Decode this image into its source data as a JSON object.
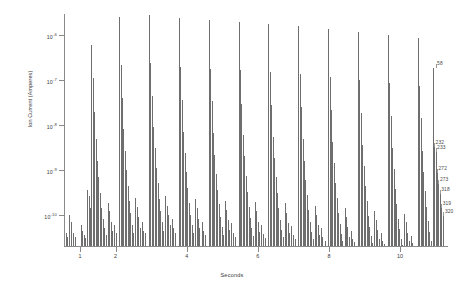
{
  "chart_data": {
    "type": "bar",
    "title": "",
    "subtitle": "",
    "xlabel": "Seconds",
    "ylabel": "Ion Current (Amperes)",
    "yscale": "log",
    "ylim": [
      2e-11,
      3e-06
    ],
    "xlim": [
      0.55,
      11.35
    ],
    "grid": false,
    "legend": null,
    "y_ticks": [
      {
        "value": 1e-06,
        "label": "10",
        "exp": "-6"
      },
      {
        "value": 1e-07,
        "label": "10",
        "exp": "-7"
      },
      {
        "value": 1e-08,
        "label": "10",
        "exp": "-8"
      },
      {
        "value": 1e-09,
        "label": "10",
        "exp": "-9"
      },
      {
        "value": 1e-10,
        "label": "10",
        "exp": "-10"
      }
    ],
    "x_ticks": [
      {
        "value": 1,
        "label": "1"
      },
      {
        "value": 2,
        "label": "2"
      },
      {
        "value": 4,
        "label": "4"
      },
      {
        "value": 6,
        "label": "6"
      },
      {
        "value": 8,
        "label": "8"
      },
      {
        "value": 10,
        "label": "10"
      }
    ],
    "annotations": [
      {
        "label": "58",
        "x": 11.0,
        "y": 2e-07
      },
      {
        "label": "232",
        "x": 10.96,
        "y": 3.4e-09
      },
      {
        "label": "233",
        "x": 11.0,
        "y": 2.6e-09
      },
      {
        "label": "272",
        "x": 11.04,
        "y": 9e-10
      },
      {
        "label": "273",
        "x": 11.08,
        "y": 5.2e-10
      },
      {
        "label": "318",
        "x": 11.12,
        "y": 3e-10
      },
      {
        "label": "319",
        "x": 11.16,
        "y": 1.5e-10
      },
      {
        "label": "320",
        "x": 11.22,
        "y": 1e-10
      }
    ],
    "series": [
      {
        "name": "Ion Current",
        "color": "#6e6e6e",
        "points": [
          [
            0.6,
            4e-11
          ],
          [
            0.64,
            3.2e-11
          ],
          [
            0.7,
            1e-10
          ],
          [
            0.74,
            7e-11
          ],
          [
            0.8,
            4e-11
          ],
          [
            0.86,
            3.2e-11
          ],
          [
            1.02,
            6e-11
          ],
          [
            1.06,
            4.4e-11
          ],
          [
            1.1,
            3.6e-11
          ],
          [
            1.14,
            3e-11
          ],
          [
            1.2,
            3.6e-10
          ],
          [
            1.24,
            2.6e-10
          ],
          [
            1.28,
            1.4e-10
          ],
          [
            1.32,
            6e-07
          ],
          [
            1.36,
            1.1e-07
          ],
          [
            1.4,
            2e-08
          ],
          [
            1.44,
            5e-09
          ],
          [
            1.48,
            1.6e-09
          ],
          [
            1.52,
            7e-10
          ],
          [
            1.56,
            3e-10
          ],
          [
            1.6,
            1.4e-10
          ],
          [
            1.64,
            8e-11
          ],
          [
            1.68,
            5e-11
          ],
          [
            1.72,
            3.6e-11
          ],
          [
            1.78,
            1.8e-10
          ],
          [
            1.82,
            1.2e-10
          ],
          [
            1.86,
            7e-11
          ],
          [
            1.9,
            4.4e-11
          ],
          [
            1.96,
            6e-11
          ],
          [
            2.0,
            4e-11
          ],
          [
            2.1,
            2.6e-06
          ],
          [
            2.14,
            2.2e-07
          ],
          [
            2.18,
            4e-08
          ],
          [
            2.22,
            8e-09
          ],
          [
            2.26,
            2.6e-09
          ],
          [
            2.3,
            1e-09
          ],
          [
            2.34,
            4.4e-10
          ],
          [
            2.38,
            2e-10
          ],
          [
            2.42,
            1.1e-10
          ],
          [
            2.46,
            6e-11
          ],
          [
            2.5,
            4e-11
          ],
          [
            2.56,
            2.4e-10
          ],
          [
            2.6,
            1.5e-10
          ],
          [
            2.64,
            9e-11
          ],
          [
            2.68,
            5e-11
          ],
          [
            2.74,
            7e-11
          ],
          [
            2.78,
            4.4e-11
          ],
          [
            2.84,
            4e-11
          ],
          [
            2.94,
            2.8e-06
          ],
          [
            2.98,
            2.4e-07
          ],
          [
            3.02,
            4.4e-08
          ],
          [
            3.06,
            9e-09
          ],
          [
            3.1,
            3e-09
          ],
          [
            3.14,
            1.1e-09
          ],
          [
            3.18,
            5e-10
          ],
          [
            3.22,
            2.2e-10
          ],
          [
            3.26,
            1.2e-10
          ],
          [
            3.3,
            7e-11
          ],
          [
            3.34,
            4.4e-11
          ],
          [
            3.4,
            2.6e-10
          ],
          [
            3.44,
            1.6e-10
          ],
          [
            3.48,
            1e-10
          ],
          [
            3.52,
            6e-11
          ],
          [
            3.58,
            8e-11
          ],
          [
            3.62,
            5e-11
          ],
          [
            3.68,
            4e-11
          ],
          [
            3.78,
            2.4e-06
          ],
          [
            3.82,
            2e-07
          ],
          [
            3.86,
            3.6e-08
          ],
          [
            3.9,
            7e-09
          ],
          [
            3.94,
            2.4e-09
          ],
          [
            3.98,
            9e-10
          ],
          [
            4.02,
            4e-10
          ],
          [
            4.06,
            1.8e-10
          ],
          [
            4.1,
            1e-10
          ],
          [
            4.14,
            6e-11
          ],
          [
            4.18,
            4e-11
          ],
          [
            4.24,
            2.2e-10
          ],
          [
            4.28,
            1.4e-10
          ],
          [
            4.32,
            8e-11
          ],
          [
            4.36,
            5e-11
          ],
          [
            4.42,
            7e-11
          ],
          [
            4.46,
            4.4e-11
          ],
          [
            4.52,
            3.6e-11
          ],
          [
            4.62,
            2.2e-06
          ],
          [
            4.66,
            1.8e-07
          ],
          [
            4.7,
            3.4e-08
          ],
          [
            4.74,
            6.6e-09
          ],
          [
            4.78,
            2.2e-09
          ],
          [
            4.82,
            8e-10
          ],
          [
            4.86,
            3.6e-10
          ],
          [
            4.9,
            1.7e-10
          ],
          [
            4.94,
            9e-11
          ],
          [
            4.98,
            5.4e-11
          ],
          [
            5.02,
            3.6e-11
          ],
          [
            5.08,
            2e-10
          ],
          [
            5.12,
            1.3e-10
          ],
          [
            5.16,
            7.6e-11
          ],
          [
            5.2,
            4.6e-11
          ],
          [
            5.26,
            6.4e-11
          ],
          [
            5.3,
            4e-11
          ],
          [
            5.36,
            3.2e-11
          ],
          [
            5.46,
            2e-06
          ],
          [
            5.5,
            1.7e-07
          ],
          [
            5.54,
            3e-08
          ],
          [
            5.58,
            6e-09
          ],
          [
            5.62,
            2e-09
          ],
          [
            5.66,
            7.4e-10
          ],
          [
            5.7,
            3.2e-10
          ],
          [
            5.74,
            1.5e-10
          ],
          [
            5.78,
            8.4e-11
          ],
          [
            5.82,
            5e-11
          ],
          [
            5.86,
            3.4e-11
          ],
          [
            5.92,
            1.9e-10
          ],
          [
            5.96,
            1.2e-10
          ],
          [
            6.0,
            7e-11
          ],
          [
            6.04,
            4.2e-11
          ],
          [
            6.1,
            6e-11
          ],
          [
            6.14,
            3.8e-11
          ],
          [
            6.2,
            3e-11
          ],
          [
            6.3,
            1.8e-06
          ],
          [
            6.34,
            1.5e-07
          ],
          [
            6.38,
            2.8e-08
          ],
          [
            6.42,
            5.4e-09
          ],
          [
            6.46,
            1.8e-09
          ],
          [
            6.5,
            6.8e-10
          ],
          [
            6.54,
            3e-10
          ],
          [
            6.58,
            1.4e-10
          ],
          [
            6.62,
            7.8e-11
          ],
          [
            6.66,
            4.6e-11
          ],
          [
            6.7,
            3.2e-11
          ],
          [
            6.76,
            1.8e-10
          ],
          [
            6.8,
            1.1e-10
          ],
          [
            6.84,
            6.4e-11
          ],
          [
            6.88,
            4e-11
          ],
          [
            6.94,
            5.6e-11
          ],
          [
            6.98,
            3.6e-11
          ],
          [
            7.04,
            2.8e-11
          ],
          [
            7.14,
            1.6e-06
          ],
          [
            7.18,
            1.35e-07
          ],
          [
            7.22,
            2.5e-08
          ],
          [
            7.26,
            4.8e-09
          ],
          [
            7.3,
            1.6e-09
          ],
          [
            7.34,
            6e-10
          ],
          [
            7.38,
            2.7e-10
          ],
          [
            7.42,
            1.25e-10
          ],
          [
            7.46,
            7e-11
          ],
          [
            7.5,
            4.2e-11
          ],
          [
            7.54,
            2.9e-11
          ],
          [
            7.6,
            1.6e-10
          ],
          [
            7.64,
            1e-10
          ],
          [
            7.68,
            5.8e-11
          ],
          [
            7.72,
            3.6e-11
          ],
          [
            7.78,
            5e-11
          ],
          [
            7.82,
            3.2e-11
          ],
          [
            7.88,
            2.6e-11
          ],
          [
            7.98,
            1.4e-06
          ],
          [
            8.02,
            1.2e-07
          ],
          [
            8.06,
            2.2e-08
          ],
          [
            8.1,
            4.2e-09
          ],
          [
            8.14,
            1.4e-09
          ],
          [
            8.18,
            5.2e-10
          ],
          [
            8.22,
            2.3e-10
          ],
          [
            8.26,
            1.1e-10
          ],
          [
            8.3,
            6.2e-11
          ],
          [
            8.34,
            3.8e-11
          ],
          [
            8.38,
            2.6e-11
          ],
          [
            8.44,
            1.4e-10
          ],
          [
            8.48,
            9e-11
          ],
          [
            8.52,
            5.2e-11
          ],
          [
            8.56,
            3.2e-11
          ],
          [
            8.62,
            4.4e-11
          ],
          [
            8.66,
            2.9e-11
          ],
          [
            8.72,
            2.4e-11
          ],
          [
            8.82,
            1.2e-06
          ],
          [
            8.86,
            1e-07
          ],
          [
            8.9,
            1.9e-08
          ],
          [
            8.94,
            3.6e-09
          ],
          [
            8.98,
            1.2e-09
          ],
          [
            9.02,
            4.4e-10
          ],
          [
            9.06,
            2e-10
          ],
          [
            9.1,
            9.4e-11
          ],
          [
            9.14,
            5.4e-11
          ],
          [
            9.18,
            3.3e-11
          ],
          [
            9.22,
            2.3e-11
          ],
          [
            9.28,
            1.2e-10
          ],
          [
            9.32,
            7.8e-11
          ],
          [
            9.36,
            4.6e-11
          ],
          [
            9.4,
            2.9e-11
          ],
          [
            9.46,
            3.9e-11
          ],
          [
            9.5,
            2.6e-11
          ],
          [
            9.56,
            2.2e-11
          ],
          [
            9.66,
            1e-06
          ],
          [
            9.7,
            8.6e-08
          ],
          [
            9.74,
            1.6e-08
          ],
          [
            9.78,
            3.1e-09
          ],
          [
            9.82,
            1.05e-09
          ],
          [
            9.86,
            3.8e-10
          ],
          [
            9.9,
            1.7e-10
          ],
          [
            9.94,
            8.2e-11
          ],
          [
            9.98,
            4.8e-11
          ],
          [
            10.02,
            2.9e-11
          ],
          [
            10.06,
            2.1e-11
          ],
          [
            10.12,
            1.05e-10
          ],
          [
            10.16,
            6.8e-11
          ],
          [
            10.2,
            4e-11
          ],
          [
            10.24,
            2.6e-11
          ],
          [
            10.3,
            3.4e-11
          ],
          [
            10.34,
            2.3e-11
          ],
          [
            10.4,
            2e-11
          ],
          [
            10.5,
            8.6e-07
          ],
          [
            10.54,
            7.4e-08
          ],
          [
            10.58,
            1.4e-08
          ],
          [
            10.62,
            2.7e-09
          ],
          [
            10.66,
            9e-10
          ],
          [
            10.7,
            3.3e-10
          ],
          [
            10.74,
            1.5e-10
          ],
          [
            10.78,
            7.2e-11
          ],
          [
            10.82,
            4.2e-11
          ],
          [
            10.86,
            2.6e-11
          ],
          [
            10.92,
            1.9e-07
          ],
          [
            10.96,
            3.4e-09
          ],
          [
            11.0,
            2.6e-09
          ],
          [
            11.04,
            9e-10
          ],
          [
            11.08,
            5.2e-10
          ],
          [
            11.12,
            3e-10
          ],
          [
            11.16,
            1.5e-10
          ],
          [
            11.22,
            1e-10
          ]
        ]
      }
    ]
  }
}
